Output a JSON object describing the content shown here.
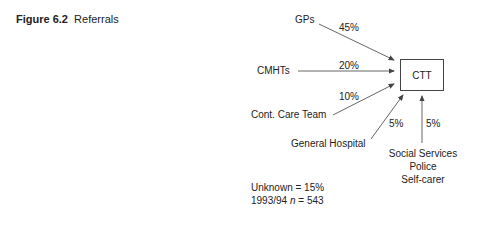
{
  "caption": {
    "number": "Figure 6.2",
    "title": "Referrals"
  },
  "target": {
    "label": "CTT"
  },
  "sources": [
    {
      "label": "GPs",
      "percent": "45%"
    },
    {
      "label": "CMHTs",
      "percent": "20%"
    },
    {
      "label": "Cont. Care Team",
      "percent": "10%"
    },
    {
      "label": "General Hospital",
      "percent": "5%"
    },
    {
      "label": "Social Services",
      "label2": "Police",
      "label3": "Self-carer",
      "percent": "5%"
    }
  ],
  "notes": {
    "unknown": "Unknown = 15%",
    "year": "1993/94",
    "n_label": "n",
    "n_value": "= 543"
  },
  "colors": {
    "line": "#555555",
    "text": "#222222"
  }
}
